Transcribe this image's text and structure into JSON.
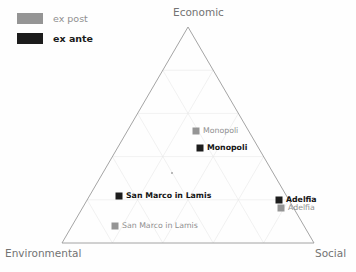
{
  "legend": {
    "items": [
      {
        "label": "ex post",
        "series": "ex_post",
        "color": "#959595"
      },
      {
        "label": "ex ante",
        "series": "ex_ante",
        "color": "#1c1c1c"
      }
    ]
  },
  "axes": {
    "top": "Economic",
    "left": "Environmental",
    "right": "Social"
  },
  "chart_data": {
    "type": "scatter",
    "subtype": "ternary",
    "title": "",
    "xlabel": "",
    "ylabel": "",
    "grid": true,
    "grid_divisions": 5,
    "legend_position": "top-left",
    "corner_labels": {
      "top": "Economic",
      "bottom_left": "Environmental",
      "bottom_right": "Social"
    },
    "axis_ranges": {
      "economic": [
        0,
        100
      ],
      "environmental": [
        0,
        100
      ],
      "social": [
        0,
        100
      ]
    },
    "series": [
      {
        "name": "ex post",
        "color": "#959595",
        "points": [
          {
            "label": "Monopoli",
            "economic": 44,
            "environmental": 28,
            "social": 28,
            "px": 196,
            "py": 131
          },
          {
            "label": "San Marco in Lamis",
            "economic": 8,
            "environmental": 51,
            "social": 41,
            "px": 115,
            "py": 226
          },
          {
            "label": "Adelfia",
            "economic": 19,
            "environmental": 8,
            "social": 73,
            "px": 281,
            "py": 208
          }
        ]
      },
      {
        "name": "ex ante",
        "color": "#1c1c1c",
        "points": [
          {
            "label": "Monopoli",
            "economic": 39,
            "environmental": 29,
            "social": 32,
            "px": 200,
            "py": 148
          },
          {
            "label": "San Marco in Lamis",
            "economic": 22,
            "environmental": 46,
            "social": 32,
            "px": 119,
            "py": 196
          },
          {
            "label": "Adelfia",
            "economic": 23,
            "environmental": 8,
            "social": 69,
            "px": 279,
            "py": 200
          }
        ]
      }
    ],
    "annotations": [
      {
        "label": "",
        "px": 172,
        "py": 173,
        "note": "faint center tick"
      }
    ]
  },
  "geometry": {
    "apex": {
      "x": 188,
      "y": 27
    },
    "bottom_left": {
      "x": 62,
      "y": 243
    },
    "bottom_right": {
      "x": 314,
      "y": 243
    }
  },
  "colors": {
    "triangle_stroke": "#9a9a9a",
    "grid_stroke": "#e8e8e8",
    "label_gray": "#737373",
    "ex_post": "#959595",
    "ex_ante": "#1c1c1c",
    "background": "#fefefe"
  }
}
